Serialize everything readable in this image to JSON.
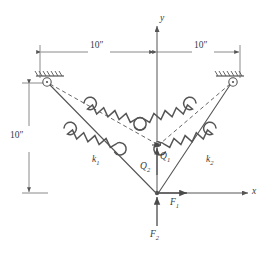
{
  "figure": {
    "type": "engineering-mechanics-diagram",
    "stroke_color": "#555555",
    "background_color": "#ffffff"
  },
  "axes": {
    "x_label": "x",
    "y_label": "y",
    "origin_label": ""
  },
  "dimensions": {
    "top_left": "10″",
    "top_right": "10″",
    "left_vertical": "10″"
  },
  "springs": [
    {
      "name": "k1",
      "label": "k",
      "subscript": "1",
      "side": "left"
    },
    {
      "name": "k2",
      "label": "k",
      "subscript": "2",
      "side": "right"
    }
  ],
  "dof": [
    {
      "name": "Q1",
      "label": "Q",
      "subscript": "1"
    },
    {
      "name": "Q2",
      "label": "Q",
      "subscript": "2"
    }
  ],
  "forces": [
    {
      "name": "F1",
      "label": "F",
      "subscript": "1",
      "direction": "horizontal-right"
    },
    {
      "name": "F2",
      "label": "F",
      "subscript": "2",
      "direction": "vertical-up"
    }
  ],
  "supports": [
    {
      "name": "support-left",
      "kind": "fixed-hatched-pin"
    },
    {
      "name": "support-right",
      "kind": "fixed-hatched-pin"
    }
  ]
}
